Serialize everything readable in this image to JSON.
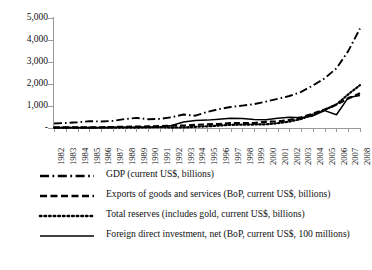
{
  "chart_data": {
    "type": "line",
    "title": "",
    "xlabel": "",
    "ylabel": "",
    "ylim": [
      0,
      5000
    ],
    "yticks": [
      "-",
      "1,000",
      "2,000",
      "3,000",
      "4,000",
      "5,000"
    ],
    "ytick_values": [
      0,
      1000,
      2000,
      3000,
      4000,
      5000
    ],
    "grid": false,
    "legend_position": "below",
    "x": [
      1982,
      1983,
      1984,
      1985,
      1986,
      1987,
      1988,
      1989,
      1990,
      1991,
      1992,
      1993,
      1994,
      1995,
      1996,
      1997,
      1998,
      1999,
      2000,
      2001,
      2002,
      2003,
      2004,
      2005,
      2006,
      2007,
      2008
    ],
    "categories": [
      "1982",
      "1983",
      "1984",
      "1985",
      "1986",
      "1987",
      "1988",
      "1989",
      "1990",
      "1991",
      "1992",
      "1993",
      "1994",
      "1995",
      "1996",
      "1997",
      "1998",
      "1999",
      "2000",
      "2001",
      "2002",
      "2003",
      "2004",
      "2005",
      "2006",
      "2007",
      "2008"
    ],
    "series": [
      {
        "name": "GDP (current US$, billions)",
        "style": "dash-dot",
        "color": "#000000",
        "values": [
          205,
          230,
          260,
          307,
          298,
          323,
          404,
          459,
          398,
          413,
          490,
          613,
          559,
          728,
          856,
          952,
          1019,
          1083,
          1198,
          1325,
          1454,
          1641,
          1932,
          2257,
          2713,
          3494,
          4522
        ]
      },
      {
        "name": "Exports of goods and services (BoP, current US$, billions)",
        "style": "dashed",
        "color": "#000000",
        "values": [
          28,
          28,
          30,
          31,
          34,
          45,
          55,
          62,
          71,
          84,
          102,
          107,
          143,
          164,
          180,
          220,
          220,
          227,
          279,
          299,
          365,
          485,
          655,
          837,
          1061,
          1342,
          1581
        ]
      },
      {
        "name": "Total reserves (includes gold, current US$, billions)",
        "style": "dotted",
        "color": "#000000",
        "values": [
          17,
          21,
          18,
          13,
          12,
          17,
          19,
          18,
          30,
          44,
          21,
          23,
          53,
          76,
          108,
          143,
          150,
          158,
          168,
          216,
          292,
          409,
          615,
          822,
          1069,
          1531,
          1950
        ]
      },
      {
        "name": "Foreign direct investment, net (BoP, current US$, 100 millions)",
        "style": "solid",
        "color": "#000000",
        "values": [
          4,
          9,
          13,
          17,
          18,
          23,
          32,
          34,
          35,
          44,
          110,
          275,
          338,
          358,
          401,
          442,
          435,
          387,
          374,
          442,
          493,
          471,
          549,
          791,
          602,
          1384,
          1475
        ]
      }
    ]
  },
  "legend": {
    "items": [
      {
        "label": "GDP (current US$, billions)",
        "style": "dash-dot"
      },
      {
        "label": "Exports of goods and services (BoP, current US$, billions)",
        "style": "dashed"
      },
      {
        "label": "Total reserves (includes gold, current US$, billions)",
        "style": "dotted"
      },
      {
        "label": "Foreign direct investment, net (BoP, current US$, 100 millions)",
        "style": "solid"
      }
    ]
  }
}
